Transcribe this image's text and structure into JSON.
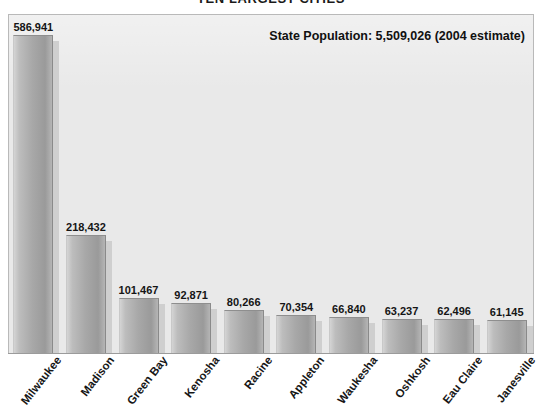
{
  "chart_data": {
    "type": "bar",
    "title": "TEN LARGEST CITIES",
    "xlabel": "",
    "ylabel": "",
    "ylim": [
      0,
      620000
    ],
    "grid": false,
    "legend": "none",
    "annotation": "State Population: 5,509,026  (2004 estimate)",
    "categories": [
      "Milwaukee",
      "Madison",
      "Green Bay",
      "Kenosha",
      "Racine",
      "Appleton",
      "Waukesha",
      "Oshkosh",
      "Eau Claire",
      "Janesville"
    ],
    "values": [
      586941,
      218432,
      101467,
      92871,
      80266,
      70354,
      66840,
      63237,
      62496,
      61145
    ],
    "value_labels": [
      "586,941",
      "218,432",
      "101,467",
      "92,871",
      "80,266",
      "70,354",
      "66,840",
      "63,237",
      "62,496",
      "61,145"
    ]
  },
  "colors": {
    "plot_background": "#e9e9e9",
    "plot_border": "#b9b9b9",
    "bar_light": "#d4d4d4",
    "bar_dark": "#9a9a9a",
    "bar_shadow": "#cfcfcf",
    "text": "#151515",
    "axis": "#9b9b9b",
    "page_background": "#ffffff"
  }
}
